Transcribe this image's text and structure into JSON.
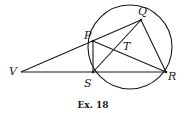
{
  "figure": {
    "caption": "Ex. 18",
    "points": {
      "P": "P",
      "Q": "Q",
      "R": "R",
      "S": "S",
      "T": "T",
      "V": "V"
    },
    "segments": [
      "VQ",
      "VR",
      "PS",
      "PR",
      "SQ",
      "QR"
    ],
    "circle_through": [
      "P",
      "Q",
      "R",
      "S"
    ],
    "intersection": "T = PR ∩ SQ",
    "colors": {
      "ink": "#1a1a1a",
      "background": "#ffffff"
    }
  }
}
